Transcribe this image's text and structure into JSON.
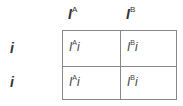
{
  "columns": [
    {
      "base": "I",
      "sup": "A"
    },
    {
      "base": "I",
      "sup": "B"
    }
  ],
  "rows": [
    {
      "label": "i"
    },
    {
      "label": "i"
    }
  ],
  "cells": [
    [
      {
        "base": "I",
        "sup": "A",
        "tail": "i"
      },
      {
        "base": "I",
        "sup": "B",
        "tail": "i"
      }
    ],
    [
      {
        "base": "I",
        "sup": "A",
        "tail": "i"
      },
      {
        "base": "I",
        "sup": "B",
        "tail": "i"
      }
    ]
  ]
}
